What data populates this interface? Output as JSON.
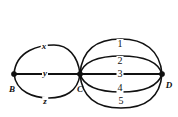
{
  "figure": {
    "type": "multigraph-diagram",
    "background_color": "#ffffff",
    "stroke_color": "#111111",
    "width": 178,
    "height": 117
  },
  "vertices": [
    {
      "id": "B",
      "label": "B",
      "x": 14,
      "y": 74,
      "label_x": 12,
      "label_y": 89
    },
    {
      "id": "C",
      "label": "C",
      "x": 80,
      "y": 74,
      "label_x": 80,
      "label_y": 89
    },
    {
      "id": "D",
      "label": "D",
      "x": 162,
      "y": 74,
      "label_x": 169,
      "label_y": 85
    }
  ],
  "edges_left": [
    {
      "id": "BC-x",
      "label": "x",
      "from": "B",
      "to": "C",
      "shape": "arc-up",
      "label_x": 44,
      "label_y": 46
    },
    {
      "id": "BC-y",
      "label": "y",
      "from": "B",
      "to": "C",
      "shape": "straight",
      "label_x": 45,
      "label_y": 73
    },
    {
      "id": "BC-z",
      "label": "z",
      "from": "B",
      "to": "C",
      "shape": "arc-down",
      "label_x": 45,
      "label_y": 101
    }
  ],
  "edges_right": [
    {
      "id": "CD-1",
      "label": "1",
      "from": "C",
      "to": "D",
      "shape": "arc-up-far",
      "label_x": 120,
      "label_y": 44
    },
    {
      "id": "CD-2",
      "label": "2",
      "from": "C",
      "to": "D",
      "shape": "arc-up-near",
      "label_x": 120,
      "label_y": 61
    },
    {
      "id": "CD-3",
      "label": "3",
      "from": "C",
      "to": "D",
      "shape": "straight",
      "label_x": 120,
      "label_y": 74
    },
    {
      "id": "CD-4",
      "label": "4",
      "from": "C",
      "to": "D",
      "shape": "arc-down-near",
      "label_x": 120,
      "label_y": 88
    },
    {
      "id": "CD-5",
      "label": "5",
      "from": "C",
      "to": "D",
      "shape": "arc-down-far",
      "label_x": 121,
      "label_y": 101
    }
  ]
}
